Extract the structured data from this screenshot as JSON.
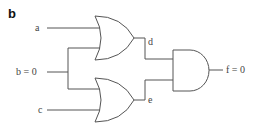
{
  "panel_label": "b",
  "inputs": {
    "a": "a",
    "b": "b = 0",
    "c": "c"
  },
  "intermediate": {
    "d": "d",
    "e": "e"
  },
  "output": {
    "f": "f = 0"
  },
  "gates": [
    {
      "id": "or-top",
      "type": "OR",
      "inputs": [
        "a",
        "b"
      ],
      "output": "d"
    },
    {
      "id": "or-bottom",
      "type": "OR",
      "inputs": [
        "b",
        "c"
      ],
      "output": "e"
    },
    {
      "id": "and-final",
      "type": "AND",
      "inputs": [
        "d",
        "e"
      ],
      "output": "f"
    }
  ],
  "colors": {
    "line": "#555555",
    "background": "#ffffff"
  }
}
